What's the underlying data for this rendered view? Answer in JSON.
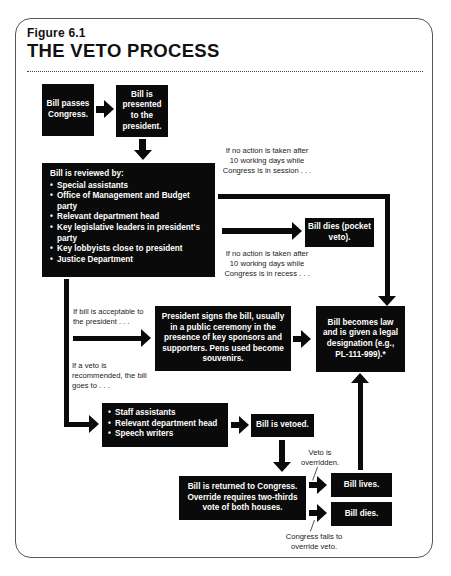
{
  "figure": {
    "label": "Figure 6.1",
    "title": "THE VETO PROCESS"
  },
  "nodes": {
    "bill_passes": "Bill passes Congress.",
    "presented": "Bill is presented to the president.",
    "review_heading": "Bill is reviewed by:",
    "review_items": [
      "Special assistants",
      "Office of Management and Budget party",
      "Relevant department head",
      "Key legislative leaders in president's party",
      "Key lobbyists close to president",
      "Justice Department"
    ],
    "pocket_veto": "Bill dies (pocket veto).",
    "president_signs": "President signs the bill, usually in a public ceremony in the presence of key sponsors and supporters. Pens used become souvenirs.",
    "becomes_law": "Bill becomes law and is given a legal designation (e.g., PL-111-999).*",
    "veto_advisors": [
      "Staff assistants",
      "Relevant department head",
      "Speech writers"
    ],
    "vetoed": "Bill is vetoed.",
    "returned": "Bill is returned to Congress. Override requires two-thirds vote of both houses.",
    "bill_lives": "Bill lives.",
    "bill_dies": "Bill dies."
  },
  "edge_labels": {
    "in_session": "If no action is taken after 10 working days while Congress is in session . . .",
    "in_recess": "If no action is taken after 10 working days while Congress is in recess . . .",
    "acceptable": "If bill is acceptable to the president . . .",
    "veto_recommended": "If a veto is recommended, the bill goes to . . .",
    "overridden": "Veto is overridden.",
    "fails_override": "Congress fails to override veto."
  },
  "colors": {
    "box_fill": "#0a0a0a",
    "box_text": "#ffffff",
    "arrow": "#0a0a0a",
    "border": "#555555"
  }
}
